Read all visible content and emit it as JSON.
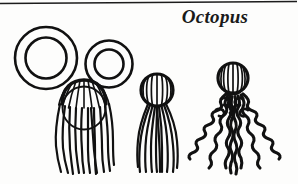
{
  "page": {
    "title": "Octopus",
    "background_color": "#fdfdfc",
    "ink_color": "#111111"
  },
  "top_rule": {
    "name": "horizontal-rule",
    "color": "#1c1c1c"
  },
  "figures": [
    {
      "id": "ring-large",
      "label": "Large yarn ring",
      "shape": "annulus",
      "cx": 46,
      "cy": 58,
      "outer_r": 31,
      "inner_r": 21
    },
    {
      "id": "ring-small",
      "label": "Small yarn ring",
      "shape": "annulus",
      "cx": 109,
      "cy": 64,
      "outer_r": 24,
      "inner_r": 15
    },
    {
      "id": "octopus-step-1",
      "label": "Octopus step 1 - dome head with loose strands",
      "head_cx": 85,
      "head_cy": 105,
      "head_r": 22,
      "tentacle_count": 11,
      "tentacle_bottom_y": 173
    },
    {
      "id": "octopus-step-2",
      "label": "Octopus step 2 - tied round head with straight strands",
      "head_cx": 157,
      "head_cy": 90,
      "head_r": 16,
      "tentacle_count": 10,
      "tentacle_bottom_y": 172
    },
    {
      "id": "octopus-step-3",
      "label": "Octopus step 3 - finished octopus with curled tentacles",
      "head_cx": 233,
      "head_cy": 78,
      "head_r": 15,
      "tentacle_count": 8,
      "tentacle_bottom_y": 176
    }
  ]
}
